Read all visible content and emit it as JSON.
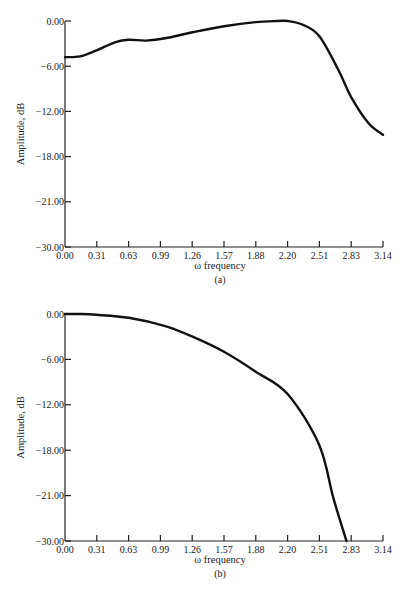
{
  "chart_data": [
    {
      "id": "a",
      "type": "line",
      "caption": "(a)",
      "title": "",
      "xlabel": "ω frequency",
      "ylabel": "Amplitude, dB",
      "x_ticks": [
        "0.00",
        "0.31",
        "0.63",
        "0.99",
        "1.26",
        "1.57",
        "1.88",
        "2.20",
        "2.51",
        "2.83",
        "3.14"
      ],
      "y_ticks": [
        "0.00",
        "-6.00",
        "-12.00",
        "-18.00",
        "-21.00",
        "-30.00"
      ],
      "xlim": [
        0,
        3.14
      ],
      "ylim": [
        -30,
        0
      ],
      "grid": false,
      "series": [
        {
          "name": "amplitude response",
          "x": [
            0.0,
            0.15,
            0.31,
            0.5,
            0.63,
            0.8,
            0.99,
            1.26,
            1.57,
            1.88,
            2.1,
            2.2,
            2.35,
            2.51,
            2.7,
            2.83,
            3.0,
            3.14
          ],
          "y": [
            -4.8,
            -4.7,
            -3.9,
            -2.8,
            -2.5,
            -2.6,
            -2.3,
            -1.5,
            -0.7,
            -0.15,
            0.0,
            0.0,
            -0.5,
            -2.0,
            -6.5,
            -10.2,
            -13.6,
            -15.1
          ]
        }
      ]
    },
    {
      "id": "b",
      "type": "line",
      "caption": "(b)",
      "title": "",
      "xlabel": "ω frequency",
      "ylabel": "Amplitude, dB",
      "x_ticks": [
        "0.00",
        "0.31",
        "0.63",
        "0.99",
        "1.26",
        "1.57",
        "1.88",
        "2.20",
        "2.51",
        "2.83",
        "3.14"
      ],
      "y_ticks": [
        "0.00",
        "-6.00",
        "-12.00",
        "-18.00",
        "-21.00",
        "-30.00"
      ],
      "xlim": [
        0,
        3.14
      ],
      "ylim": [
        -30,
        0
      ],
      "grid": false,
      "series": [
        {
          "name": "amplitude response",
          "x": [
            0.0,
            0.15,
            0.31,
            0.63,
            0.99,
            1.26,
            1.57,
            1.88,
            2.2,
            2.51,
            2.65,
            2.78
          ],
          "y": [
            0.0,
            0.0,
            -0.1,
            -0.5,
            -1.6,
            -3.0,
            -5.0,
            -7.6,
            -10.6,
            -17.3,
            -21.5,
            -30.0
          ]
        }
      ]
    }
  ],
  "colors": {
    "curve": "#111111",
    "axis": "#222222",
    "background": "#ffffff"
  }
}
